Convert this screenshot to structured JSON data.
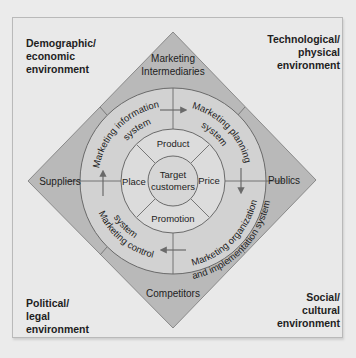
{
  "environments": {
    "top_left": "Demographic/\neconomic\nenvironment",
    "top_right": "Technological/\nphysical\nenvironment",
    "bottom_left": "Political/\nlegal\nenvironment",
    "bottom_right": "Social/\ncultural\nenvironment"
  },
  "actors": {
    "top_line1": "Marketing",
    "top_line2": "Intermediaries",
    "left": "Suppliers",
    "right": "Publics",
    "bottom": "Competitors"
  },
  "systems": {
    "information": "Marketing information system",
    "planning": "Marketing planning system",
    "organization": "Marketing organization and implementation system",
    "control": "Marketing control system",
    "information_line1": "Marketing information",
    "information_line2": "system",
    "planning_line1": "Marketing planning",
    "planning_line2": "system",
    "organization_line1": "Marketing organization",
    "organization_line2": "and implementation system",
    "control_line1": "Marketing control",
    "control_line2": "system"
  },
  "marketing_mix": {
    "product": "Product",
    "price": "Price",
    "promotion": "Promotion",
    "place": "Place"
  },
  "center": {
    "line1": "Target",
    "line2": "customers"
  },
  "colors": {
    "background": "#e9e9e9",
    "diamond_fill": "#b9b9b9",
    "outer_circle_fill": "#d2d2d2",
    "inner_ring_fill": "#dcdcdc",
    "center_fill": "#d6d6d6",
    "stroke": "#6a6a6a",
    "text": "#222222"
  }
}
